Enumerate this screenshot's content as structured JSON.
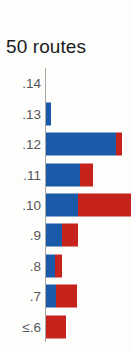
{
  "chart_data": {
    "type": "bar",
    "orientation": "horizontal",
    "stacked": true,
    "title": "50 routes",
    "xlabel": "",
    "ylabel": "",
    "grid": false,
    "legend_position": "none",
    "xlim": [
      0,
      100
    ],
    "categories": [
      ".14",
      ".13",
      ".12",
      ".11",
      ".10",
      ".9",
      ".8",
      ".7",
      "≤.6"
    ],
    "series": [
      {
        "name": "blue",
        "color": "#1a5aa8",
        "values": [
          0,
          6,
          82,
          40,
          38,
          19,
          10,
          12,
          0
        ]
      },
      {
        "name": "red",
        "color": "#c5231b",
        "values": [
          0,
          0,
          7,
          15,
          62,
          19,
          9,
          24,
          23
        ]
      }
    ],
    "bars": [
      {
        "label": ".14",
        "blue": 0,
        "red": 0
      },
      {
        "label": ".13",
        "blue": 6,
        "red": 0
      },
      {
        "label": ".12",
        "blue": 82,
        "red": 7
      },
      {
        "label": ".11",
        "blue": 40,
        "red": 15
      },
      {
        "label": ".10",
        "blue": 38,
        "red": 62
      },
      {
        "label": ".9",
        "blue": 19,
        "red": 19
      },
      {
        "label": ".8",
        "blue": 10,
        "red": 9
      },
      {
        "label": ".7",
        "blue": 12,
        "red": 24
      },
      {
        "label": "≤.6",
        "blue": 0,
        "red": 23
      }
    ],
    "colors": {
      "blue": "#1a5aa8",
      "red": "#c5231b",
      "axis": "#a9a9a4",
      "title_text": "#1b1b1b",
      "tick_text": "#56565a",
      "background": "#fdfdfc"
    }
  }
}
